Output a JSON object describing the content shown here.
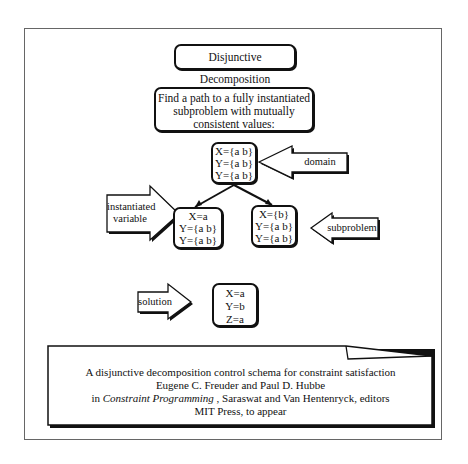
{
  "title": "Disjunctive Decomposition",
  "goal": {
    "lines": [
      "Find a path to a fully instantiated",
      "subproblem with mutually",
      "consistent values:"
    ]
  },
  "nodes": {
    "root": [
      "X={a b}",
      "Y={a b}",
      "Y={a b}"
    ],
    "left": [
      "X=a",
      "Y={a b}",
      "Y={a b}"
    ],
    "right": [
      "X={b}",
      "Y={a b}",
      "Y={a b}"
    ],
    "solution": [
      "X=a",
      "Y=b",
      "Z=a"
    ]
  },
  "arrows": {
    "domain": "domain",
    "instantiated_variable": [
      "instantiated",
      "variable"
    ],
    "subproblem": "subproblem",
    "solution": "solution"
  },
  "citation": {
    "line1": "A disjunctive decomposition control schema for constraint satisfaction",
    "line2": "Eugene C. Freuder and Paul D. Hubbe",
    "line3_prefix": "in ",
    "line3_italic": "Constraint Programming",
    "line3_suffix": " , Saraswat and Van Hentenryck, editors",
    "line4": "MIT Press, to appear"
  }
}
